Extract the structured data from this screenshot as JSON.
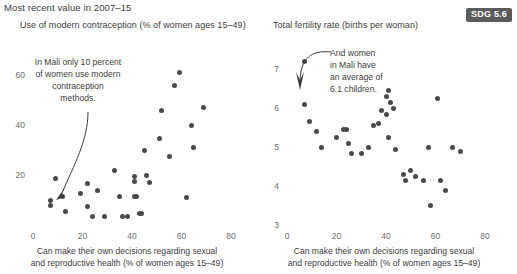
{
  "supertitle": "Most recent value in 2007–15",
  "badge": {
    "label": "SDG 5.6",
    "color": "#5b5b5b"
  },
  "shared": {
    "xlabel_line1": "Can make their own decisions regarding sexual",
    "xlabel_line2": "and reproductive health (% of women ages 15–49)"
  },
  "chart_data": [
    {
      "type": "scatter",
      "title": "Use of modern contraception (% of women ages 15–49)",
      "xlabel": "Can make their own decisions regarding sexual and reproductive health (% of women ages 15–49)",
      "ylabel": "",
      "xlim": [
        0,
        80
      ],
      "ylim": [
        0,
        70
      ],
      "xticks": [
        0,
        20,
        40,
        60,
        80
      ],
      "yticks": [
        20,
        40,
        60
      ],
      "grid": false,
      "legend": "none",
      "marker_color": "#4a4a4a",
      "annotation": {
        "text": "In Mali only 10 percent\nof women use modern\ncontraception\nmethods.",
        "points_to": [
          7,
          10
        ]
      },
      "points": [
        [
          7,
          10
        ],
        [
          7,
          8
        ],
        [
          9,
          18.5
        ],
        [
          12,
          11.5
        ],
        [
          13,
          5.5
        ],
        [
          19,
          12.5
        ],
        [
          22,
          16.5
        ],
        [
          22,
          7.5
        ],
        [
          24,
          3.5
        ],
        [
          26,
          14
        ],
        [
          29,
          3.5
        ],
        [
          33,
          22
        ],
        [
          35,
          11.5
        ],
        [
          36,
          3.5
        ],
        [
          38,
          3.5
        ],
        [
          41,
          19.5
        ],
        [
          41,
          17.5
        ],
        [
          41,
          11.5
        ],
        [
          42,
          11.5
        ],
        [
          43,
          4.5
        ],
        [
          44,
          4.5
        ],
        [
          45,
          30
        ],
        [
          46,
          20
        ],
        [
          47,
          17
        ],
        [
          51,
          34.5
        ],
        [
          52,
          46
        ],
        [
          55,
          27.5
        ],
        [
          57,
          56
        ],
        [
          59,
          61
        ],
        [
          62,
          11
        ],
        [
          64,
          40
        ],
        [
          65,
          31
        ],
        [
          69,
          47
        ]
      ]
    },
    {
      "type": "scatter",
      "title": "Total fertility rate (births per woman)",
      "xlabel": "Can make their own decisions regarding sexual and reproductive health (% of women ages 15–49)",
      "ylabel": "",
      "xlim": [
        0,
        80
      ],
      "ylim": [
        3,
        7.5
      ],
      "xticks": [
        0,
        20,
        40,
        60,
        80
      ],
      "yticks": [
        3,
        4,
        5,
        6,
        7
      ],
      "grid": false,
      "legend": "none",
      "marker_color": "#4a4a4a",
      "annotation": {
        "text": "And women\nin Mali have\nan average of\n6.1 children.",
        "points_to": [
          7,
          6.1
        ]
      },
      "points": [
        [
          7,
          7.2
        ],
        [
          7,
          6.1
        ],
        [
          9,
          5.65
        ],
        [
          12,
          5.4
        ],
        [
          14,
          5.0
        ],
        [
          20,
          5.25
        ],
        [
          23,
          5.45
        ],
        [
          24,
          5.45
        ],
        [
          25,
          5.1
        ],
        [
          26,
          4.85
        ],
        [
          30,
          4.85
        ],
        [
          33,
          5.0
        ],
        [
          35,
          5.55
        ],
        [
          37,
          5.6
        ],
        [
          38,
          5.95
        ],
        [
          40,
          5.85
        ],
        [
          40,
          6.3
        ],
        [
          41,
          5.25
        ],
        [
          41,
          6.45
        ],
        [
          42,
          6.15
        ],
        [
          43,
          6.0
        ],
        [
          44,
          4.95
        ],
        [
          47,
          4.3
        ],
        [
          48,
          4.15
        ],
        [
          50,
          4.4
        ],
        [
          52,
          4.25
        ],
        [
          55,
          4.15
        ],
        [
          57,
          5.0
        ],
        [
          58,
          3.5
        ],
        [
          61,
          6.25
        ],
        [
          62,
          4.15
        ],
        [
          64,
          3.9
        ],
        [
          67,
          5.0
        ],
        [
          70,
          4.9
        ]
      ]
    }
  ]
}
